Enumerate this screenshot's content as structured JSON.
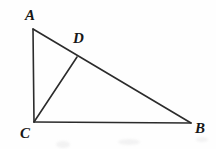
{
  "figure": {
    "kind": "geometry-diagram",
    "background_color": "#fefefe",
    "stroke_color": "#2b2b2b",
    "label_color": "#171717",
    "width": 216,
    "height": 149,
    "points": {
      "A": {
        "name": "A",
        "x": 33,
        "y": 29
      },
      "B": {
        "name": "B",
        "x": 191,
        "y": 123
      },
      "C": {
        "name": "C",
        "x": 34,
        "y": 122
      },
      "D": {
        "name": "D",
        "x": 77,
        "y": 57
      }
    },
    "segments": [
      {
        "name": "AB",
        "from": "A",
        "to": "B",
        "stroke_width": 1.6
      },
      {
        "name": "AC",
        "from": "A",
        "to": "C",
        "stroke_width": 1.6
      },
      {
        "name": "CB",
        "from": "C",
        "to": "B",
        "stroke_width": 1.6
      },
      {
        "name": "CD",
        "from": "C",
        "to": "D",
        "stroke_width": 1.6
      }
    ],
    "labels": [
      {
        "name": "label-A",
        "text": "A",
        "x": 25,
        "y": 8
      },
      {
        "name": "label-D",
        "text": "D",
        "x": 73,
        "y": 31
      },
      {
        "name": "label-C",
        "text": "C",
        "x": 20,
        "y": 126
      },
      {
        "name": "label-B",
        "text": "B",
        "x": 195,
        "y": 121
      }
    ],
    "artifacts": [
      {
        "name": "scan-smudge-left",
        "x": 56,
        "y": 141,
        "w": 14,
        "h": 7
      },
      {
        "name": "scan-smudge-center",
        "x": 118,
        "y": 139,
        "w": 22,
        "h": 6
      },
      {
        "name": "scan-smudge-right",
        "x": 196,
        "y": 137,
        "w": 12,
        "h": 5
      }
    ]
  }
}
